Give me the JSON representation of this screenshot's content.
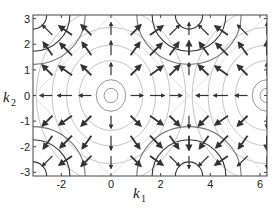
{
  "chart_data": {
    "type": "contour+quiver",
    "title": "",
    "xlabel": "k",
    "xlabel_sub": "1",
    "ylabel": "k",
    "ylabel_sub": "2",
    "xlim": [
      -3.14159,
      6.28318
    ],
    "ylim": [
      -3.14159,
      3.14159
    ],
    "xticks": [
      -2,
      0,
      2,
      4,
      6
    ],
    "yticks": [
      -3,
      -2,
      -1,
      0,
      1,
      2,
      3
    ],
    "grid": false,
    "legend": null,
    "function_description": "Band energy E(k1,k2) with minima at (0,0) and (2pi,0) and maxima at (pi,+-pi),(-pi,+-pi); arrows show gradient (group velocity) field",
    "contours": {
      "dark_levels_around_maxima": [
        {
          "center": [
            3.14159,
            3.14159
          ],
          "radii": [
            0.55,
            1.35,
            1.75
          ]
        },
        {
          "center": [
            3.14159,
            -3.14159
          ],
          "radii": [
            0.55,
            1.35,
            1.75
          ]
        },
        {
          "center": [
            -3.14159,
            3.14159
          ],
          "radii": [
            0.55,
            1.35,
            1.75
          ]
        },
        {
          "center": [
            -3.14159,
            -3.14159
          ],
          "radii": [
            0.55,
            1.35,
            1.75
          ]
        }
      ],
      "light_levels_around_minima": [
        {
          "center": [
            0,
            0
          ],
          "radii": [
            0.28,
            0.55,
            1.1,
            1.45,
            1.8,
            2.15
          ]
        },
        {
          "center": [
            6.28318,
            0
          ],
          "radii": [
            0.28,
            0.55,
            1.1,
            1.45,
            1.8,
            2.15
          ]
        }
      ]
    },
    "quiver_grid": {
      "x": [
        -2.36,
        -1.57,
        -0.79,
        0,
        0.79,
        1.57,
        2.36,
        3.14,
        3.93,
        4.71,
        5.5,
        6.28
      ],
      "y": [
        2.36,
        1.57,
        0.79,
        0,
        -0.79,
        -1.57,
        -2.36
      ]
    }
  },
  "axes": {
    "x_tick_labels": [
      "-2",
      "0",
      "2",
      "4",
      "6"
    ],
    "y_tick_labels": [
      "3",
      "2",
      "1",
      "0",
      "-1",
      "-2",
      "-3"
    ]
  }
}
